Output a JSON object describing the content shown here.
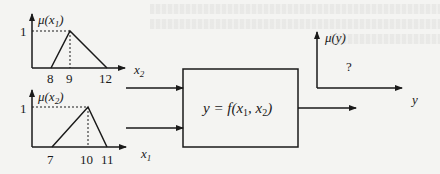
{
  "diagram": {
    "input_plot_1": {
      "y_label": "μ(x",
      "y_label_sub": "1",
      "y_tick": "1",
      "x_label": "x",
      "x_label_sub": "2",
      "x_ticks": [
        "8",
        "9",
        "12"
      ],
      "membership": {
        "left": 8,
        "peak": 9,
        "right": 12
      }
    },
    "input_plot_2": {
      "y_label": "μ(x",
      "y_label_sub": "2",
      "y_tick": "1",
      "x_label": "x",
      "x_label_sub": "1",
      "x_ticks": [
        "7",
        "10",
        "11"
      ],
      "membership": {
        "left": 7,
        "peak": 10,
        "right": 11
      }
    },
    "inputs": [
      {
        "label": "x",
        "sub": "2"
      },
      {
        "label": "x",
        "sub": "1"
      }
    ],
    "system_box": {
      "pre": "y = f(x",
      "sub1": "1",
      "mid": ", x",
      "sub2": "2",
      "post": ")"
    },
    "output_plot": {
      "y_label": "μ(y)",
      "unknown": "?",
      "x_label": "y"
    }
  }
}
